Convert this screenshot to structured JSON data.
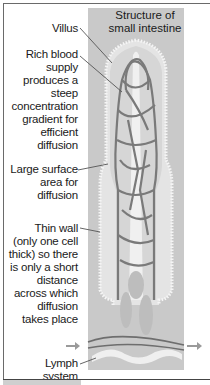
{
  "diagram": {
    "title": "Structure of\nsmall intestine",
    "labels": [
      {
        "id": "villus",
        "text": "Villus"
      },
      {
        "id": "blood-supply",
        "text": "Rich blood\nsupply\nproduces a\nsteep\nconcentration\ngradient for\nefficient\ndiffusion"
      },
      {
        "id": "surface-area",
        "text": "Large surface\narea for\ndiffusion"
      },
      {
        "id": "thin-wall",
        "text": "Thin wall\n(only one cell\nthick) so there\nis only a short\ndistance\nacross which\ndiffusion\ntakes place"
      },
      {
        "id": "lymph",
        "text": "Lymph\nsystem"
      }
    ],
    "colors": {
      "background_panel": "#c9c9c9",
      "villus_fill": "#dcdcdc",
      "villus_core": "#f2f2f2",
      "vessels": "#7a7a7a",
      "lymph": "#efefef",
      "arrow": "#9a9a9a"
    }
  }
}
